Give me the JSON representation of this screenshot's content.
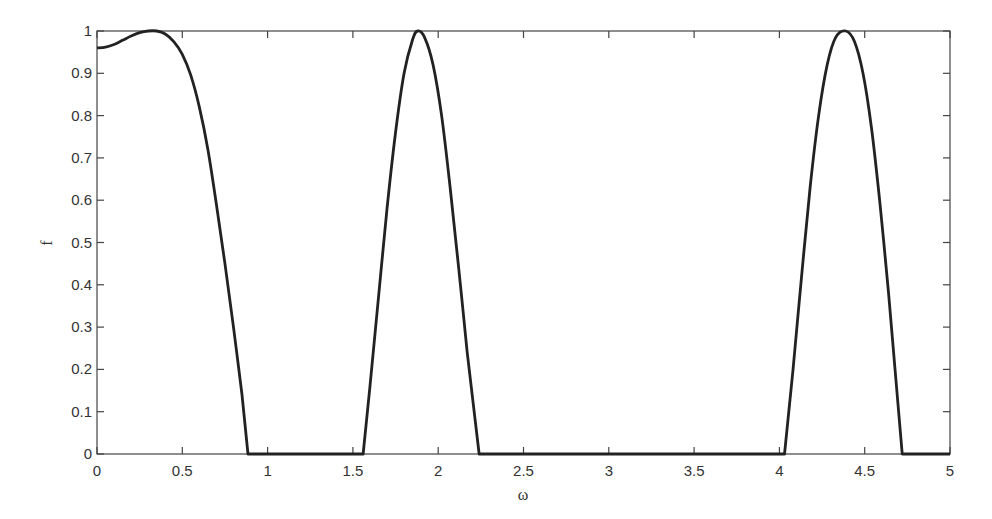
{
  "chart_data": {
    "type": "line",
    "title": "",
    "xlabel": "ω",
    "ylabel": "f",
    "xlim": [
      0,
      5
    ],
    "ylim": [
      0,
      1
    ],
    "grid": false,
    "legend": null,
    "xticks": [
      0,
      0.5,
      1,
      1.5,
      2,
      2.5,
      3,
      3.5,
      4,
      4.5,
      5
    ],
    "xtick_labels": [
      "0",
      "0.5",
      "1",
      "1.5",
      "2",
      "2.5",
      "3",
      "3.5",
      "4",
      "4.5",
      "5"
    ],
    "yticks": [
      0,
      0.1,
      0.2,
      0.3,
      0.4,
      0.5,
      0.6,
      0.7,
      0.8,
      0.9,
      1
    ],
    "ytick_labels": [
      "0",
      "0.1",
      "0.2",
      "0.3",
      "0.4",
      "0.5",
      "0.6",
      "0.7",
      "0.8",
      "0.9",
      "1"
    ],
    "series": [
      {
        "name": "f(ω)",
        "color": "#222222",
        "x": [
          0,
          0.05,
          0.1,
          0.15,
          0.2,
          0.25,
          0.3,
          0.35,
          0.4,
          0.45,
          0.5,
          0.55,
          0.6,
          0.65,
          0.7,
          0.75,
          0.8,
          0.85,
          0.885,
          0.9,
          1.0,
          1.2,
          1.4,
          1.56,
          1.6,
          1.65,
          1.7,
          1.75,
          1.8,
          1.85,
          1.88,
          1.92,
          1.97,
          2.02,
          2.07,
          2.12,
          2.17,
          2.24,
          2.3,
          2.6,
          3.0,
          3.4,
          3.8,
          4.03,
          4.08,
          4.13,
          4.18,
          4.23,
          4.28,
          4.33,
          4.39,
          4.44,
          4.49,
          4.54,
          4.59,
          4.64,
          4.72,
          4.8,
          5.0
        ],
        "y": [
          0.96,
          0.962,
          0.968,
          0.978,
          0.988,
          0.996,
          1.0,
          1.0,
          0.993,
          0.975,
          0.945,
          0.895,
          0.82,
          0.72,
          0.59,
          0.45,
          0.3,
          0.14,
          0.0,
          0.0,
          0.0,
          0.0,
          0.0,
          0.0,
          0.16,
          0.37,
          0.58,
          0.76,
          0.9,
          0.98,
          1.0,
          0.985,
          0.92,
          0.8,
          0.63,
          0.44,
          0.24,
          0.0,
          0.0,
          0.0,
          0.0,
          0.0,
          0.0,
          0.0,
          0.2,
          0.42,
          0.63,
          0.8,
          0.92,
          0.985,
          1.0,
          0.975,
          0.9,
          0.77,
          0.59,
          0.38,
          0.0,
          0.0,
          0.0
        ]
      }
    ]
  }
}
